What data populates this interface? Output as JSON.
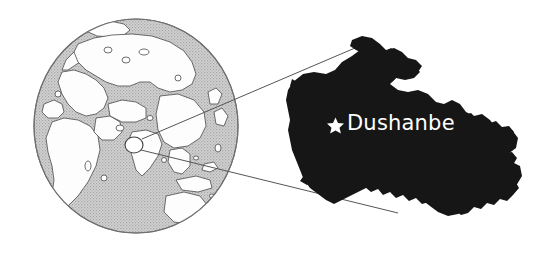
{
  "figure": {
    "background_color": "#ffffff"
  },
  "globe": {
    "name": "globe-inset",
    "center_x": 136,
    "center_y": 126,
    "radius_x": 102,
    "radius_y": 107,
    "ocean_color": "#c6c6c6",
    "land_color": "#ffffff",
    "outline_color": "#555555",
    "marker": {
      "name": "location-marker-circle",
      "cx": 134,
      "cy": 145,
      "rx": 9,
      "ry": 8,
      "fill": "#ffffff",
      "stroke": "#444444"
    }
  },
  "leader_lines": {
    "name": "zoom-leader-lines",
    "color": "#555555",
    "upper": {
      "x1": 142,
      "y1": 139,
      "x2": 369,
      "y2": 42
    },
    "lower": {
      "x1": 141,
      "y1": 150,
      "x2": 398,
      "y2": 213
    }
  },
  "country_map": {
    "name": "tajikistan-shape",
    "country": "Tajikistan",
    "fill_color": "#161616",
    "bounds": {
      "x": 288,
      "y": 38,
      "width": 234,
      "height": 180
    }
  },
  "capital": {
    "name": "Dushanbe",
    "label": "Dushanbe",
    "marker_glyph": "star",
    "label_color": "#ffffff",
    "star": {
      "cx": 335,
      "cy": 125,
      "r": 7,
      "fill": "#ffffff"
    }
  }
}
